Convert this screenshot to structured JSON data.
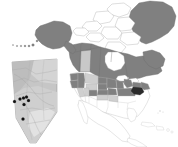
{
  "figure": {
    "type": "choropleth-map",
    "title": "",
    "width": 178,
    "height": 147,
    "background_color": "#ffffff"
  },
  "palette": {
    "dark_gray_fill": "#808080",
    "mid_gray_fill": "#9a9a9a",
    "light_gray_fill": "#c8c8c8",
    "pale_gray_fill": "#dcdcdc",
    "white_fill": "#ffffff",
    "highlight_fill": "#2b2b2b",
    "outline_stroke": "#6e6e6e",
    "thin_outline_stroke": "#b4b4b4",
    "point_color": "#111111",
    "inset_fill": "#c6c6c6",
    "inset_outline": "#8f8f8f"
  },
  "main_map": {
    "name": "north-america-choropleth",
    "regions": [
      {
        "name": "greenland",
        "shade": "dark_gray_fill"
      },
      {
        "name": "canada-arctic-islands",
        "shade": "white_fill"
      },
      {
        "name": "alaska",
        "shade": "dark_gray_fill"
      },
      {
        "name": "yukon",
        "shade": "dark_gray_fill"
      },
      {
        "name": "northwest-territories",
        "shade": "dark_gray_fill"
      },
      {
        "name": "nunavut",
        "shade": "dark_gray_fill"
      },
      {
        "name": "british-columbia",
        "shade": "dark_gray_fill"
      },
      {
        "name": "alberta",
        "shade": "light_gray_fill"
      },
      {
        "name": "saskatchewan",
        "shade": "dark_gray_fill"
      },
      {
        "name": "manitoba",
        "shade": "dark_gray_fill"
      },
      {
        "name": "ontario",
        "shade": "dark_gray_fill"
      },
      {
        "name": "quebec",
        "shade": "dark_gray_fill"
      },
      {
        "name": "labrador-newfoundland",
        "shade": "dark_gray_fill"
      },
      {
        "name": "maritimes",
        "shade": "dark_gray_fill"
      },
      {
        "name": "washington",
        "shade": "dark_gray_fill"
      },
      {
        "name": "oregon",
        "shade": "dark_gray_fill"
      },
      {
        "name": "idaho",
        "shade": "dark_gray_fill"
      },
      {
        "name": "montana",
        "shade": "light_gray_fill"
      },
      {
        "name": "north-dakota",
        "shade": "dark_gray_fill"
      },
      {
        "name": "minnesota",
        "shade": "dark_gray_fill"
      },
      {
        "name": "wisconsin",
        "shade": "dark_gray_fill"
      },
      {
        "name": "michigan",
        "shade": "dark_gray_fill"
      },
      {
        "name": "new-york",
        "shade": "dark_gray_fill"
      },
      {
        "name": "new-england",
        "shade": "dark_gray_fill"
      },
      {
        "name": "pennsylvania-new-jersey",
        "shade": "highlight_fill"
      },
      {
        "name": "wyoming",
        "shade": "light_gray_fill"
      },
      {
        "name": "south-dakota",
        "shade": "dark_gray_fill"
      },
      {
        "name": "nebraska",
        "shade": "dark_gray_fill"
      },
      {
        "name": "iowa",
        "shade": "dark_gray_fill"
      },
      {
        "name": "illinois-indiana-ohio",
        "shade": "dark_gray_fill"
      },
      {
        "name": "nevada",
        "shade": "light_gray_fill"
      },
      {
        "name": "utah",
        "shade": "light_gray_fill"
      },
      {
        "name": "colorado",
        "shade": "dark_gray_fill"
      },
      {
        "name": "kansas",
        "shade": "light_gray_fill"
      },
      {
        "name": "missouri",
        "shade": "light_gray_fill"
      },
      {
        "name": "california",
        "shade": "white_fill"
      },
      {
        "name": "arizona",
        "shade": "white_fill"
      },
      {
        "name": "new-mexico",
        "shade": "white_fill"
      },
      {
        "name": "texas",
        "shade": "white_fill"
      },
      {
        "name": "oklahoma",
        "shade": "white_fill"
      },
      {
        "name": "southeast-states",
        "shade": "white_fill"
      },
      {
        "name": "florida",
        "shade": "white_fill"
      },
      {
        "name": "mexico",
        "shade": "white_fill"
      },
      {
        "name": "central-america",
        "shade": "white_fill"
      },
      {
        "name": "caribbean-islands",
        "shade": "white_fill"
      }
    ]
  },
  "inset_map": {
    "name": "alberta-inset",
    "region_label": "",
    "fill": "inset_fill",
    "points_label": "sampling sites",
    "points_count": 7,
    "points": [
      {
        "id": 1,
        "x": 14.5,
        "y": 101.5
      },
      {
        "id": 2,
        "x": 20.0,
        "y": 99.0
      },
      {
        "id": 3,
        "x": 23.5,
        "y": 98.0
      },
      {
        "id": 4,
        "x": 26.5,
        "y": 97.0
      },
      {
        "id": 5,
        "x": 28.5,
        "y": 100.5
      },
      {
        "id": 6,
        "x": 24.0,
        "y": 104.5
      },
      {
        "id": 7,
        "x": 23.0,
        "y": 119.0
      }
    ]
  },
  "annotations": []
}
